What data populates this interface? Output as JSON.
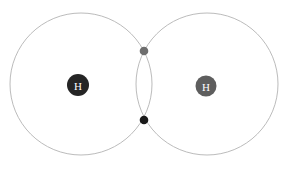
{
  "diagram": {
    "background_color": "#ffffff",
    "canvas": {
      "width": 287,
      "height": 169
    },
    "shells": [
      {
        "name": "left-electron-shell",
        "cx": 81,
        "cy": 84,
        "r": 71,
        "stroke_color": "#b3b3b3",
        "stroke_width": 0.9
      },
      {
        "name": "right-electron-shell",
        "cx": 207,
        "cy": 84,
        "r": 71,
        "stroke_color": "#b3b3b3",
        "stroke_width": 0.9
      }
    ],
    "atoms": [
      {
        "name": "left-hydrogen-nucleus",
        "label": "H",
        "cx": 78,
        "cy": 85,
        "r": 11,
        "fill_color": "#252525",
        "text_color": "#ffffff"
      },
      {
        "name": "right-hydrogen-nucleus",
        "label": "H",
        "cx": 206,
        "cy": 86,
        "r": 10.5,
        "fill_color": "#5e5e5e",
        "text_color": "#ffffff"
      }
    ],
    "electrons": [
      {
        "name": "shared-electron-top",
        "cx": 144,
        "cy": 51,
        "r": 4.3,
        "fill_color": "#6e6e6e"
      },
      {
        "name": "shared-electron-bottom",
        "cx": 144,
        "cy": 120,
        "r": 4.3,
        "fill_color": "#1a1a1a"
      }
    ]
  },
  "chart_data": {
    "type": "diagram",
    "subtitle": "",
    "elements": [
      {
        "kind": "circle",
        "role": "electron-shell",
        "label": "left shell",
        "center": [
          81,
          84
        ],
        "radius": 71,
        "color": "#b3b3b3"
      },
      {
        "kind": "circle",
        "role": "electron-shell",
        "label": "right shell",
        "center": [
          207,
          84
        ],
        "radius": 71,
        "color": "#b3b3b3"
      },
      {
        "kind": "disc",
        "role": "nucleus",
        "label": "H",
        "center": [
          78,
          85
        ],
        "radius": 11,
        "color": "#252525"
      },
      {
        "kind": "disc",
        "role": "nucleus",
        "label": "H",
        "center": [
          206,
          86
        ],
        "radius": 10.5,
        "color": "#5e5e5e"
      },
      {
        "kind": "dot",
        "role": "shared-electron",
        "label": "",
        "center": [
          144,
          51
        ],
        "radius": 4.3,
        "color": "#6e6e6e"
      },
      {
        "kind": "dot",
        "role": "shared-electron",
        "label": "",
        "center": [
          144,
          120
        ],
        "radius": 4.3,
        "color": "#1a1a1a"
      }
    ],
    "labels": [
      "H",
      "H"
    ],
    "xlabel": "",
    "ylabel": "",
    "legend": []
  }
}
